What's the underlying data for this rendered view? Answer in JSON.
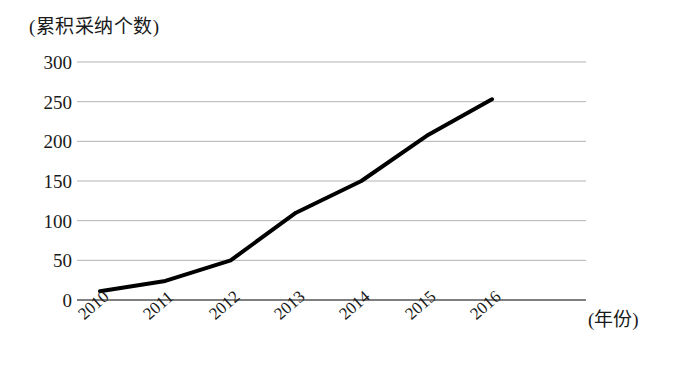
{
  "chart_data": {
    "type": "line",
    "title": "",
    "ylabel": "(累积采纳个数)",
    "xlabel": "(年份)",
    "categories": [
      "2010",
      "2011",
      "2012",
      "2013",
      "2014",
      "2015",
      "2016"
    ],
    "values": [
      11,
      24,
      50,
      110,
      150,
      207,
      253
    ],
    "series": [
      {
        "name": "累积采纳个数",
        "values": [
          11,
          24,
          50,
          110,
          150,
          207,
          253
        ],
        "color": "#000000"
      }
    ],
    "ylim": [
      0,
      300
    ],
    "yticks": [
      0,
      50,
      100,
      150,
      200,
      250,
      300
    ],
    "ytick_labels": [
      "0",
      "50",
      "100",
      "150",
      "200",
      "250",
      "300"
    ],
    "grid": true,
    "grid_color": "#b3b3b3",
    "axis_color": "#555555",
    "legend": null,
    "legend_position": "none",
    "marker": "none",
    "line_width": 4
  }
}
